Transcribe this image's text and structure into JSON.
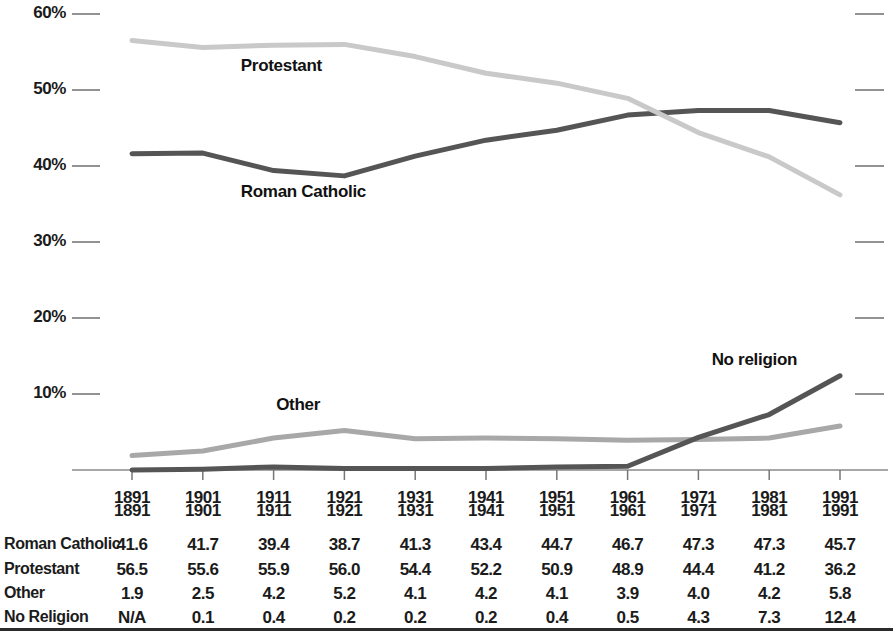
{
  "chart_data": {
    "type": "line",
    "title": "",
    "subtitle": "",
    "xlabel": "",
    "ylabel": "",
    "x": [
      1891,
      1901,
      1911,
      1921,
      1931,
      1941,
      1951,
      1961,
      1971,
      1981,
      1991
    ],
    "categories": [
      "1891",
      "1901",
      "1911",
      "1921",
      "1931",
      "1941",
      "1951",
      "1961",
      "1971",
      "1981",
      "1991"
    ],
    "ylim": [
      0,
      60
    ],
    "y_ticks": [
      10,
      20,
      30,
      40,
      50,
      60
    ],
    "y_tick_labels": [
      "10%",
      "20%",
      "30%",
      "40%",
      "50%",
      "60%"
    ],
    "grid": false,
    "legend_position": "inline-annotations",
    "series": [
      {
        "name": "Roman Catholic",
        "label": "Roman Catholic",
        "color": "#555555",
        "values": [
          41.6,
          41.7,
          39.4,
          38.7,
          41.3,
          43.4,
          44.7,
          46.7,
          47.3,
          47.3,
          45.7
        ],
        "display_values": [
          "41.6",
          "41.7",
          "39.4",
          "38.7",
          "41.3",
          "43.4",
          "44.7",
          "46.7",
          "47.3",
          "47.3",
          "45.7"
        ]
      },
      {
        "name": "Protestant",
        "label": "Protestant",
        "color": "#c9c9c9",
        "values": [
          56.5,
          55.6,
          55.9,
          56.0,
          54.4,
          52.2,
          50.9,
          48.9,
          44.4,
          41.2,
          36.2
        ],
        "display_values": [
          "56.5",
          "55.6",
          "55.9",
          "56.0",
          "54.4",
          "52.2",
          "50.9",
          "48.9",
          "44.4",
          "41.2",
          "36.2"
        ]
      },
      {
        "name": "Other",
        "label": "Other",
        "color": "#a8a8a8",
        "values": [
          1.9,
          2.5,
          4.2,
          5.2,
          4.1,
          4.2,
          4.1,
          3.9,
          4.0,
          4.2,
          5.8
        ],
        "display_values": [
          "1.9",
          "2.5",
          "4.2",
          "5.2",
          "4.1",
          "4.2",
          "4.1",
          "3.9",
          "4.0",
          "4.2",
          "5.8"
        ]
      },
      {
        "name": "No religion",
        "label": "No religion",
        "color": "#555555",
        "values": [
          0.0,
          0.1,
          0.4,
          0.2,
          0.2,
          0.2,
          0.4,
          0.5,
          4.3,
          7.3,
          12.4
        ],
        "display_values": [
          "N/A",
          "0.1",
          "0.4",
          "0.2",
          "0.2",
          "0.2",
          "0.4",
          "0.5",
          "4.3",
          "7.3",
          "12.4"
        ]
      }
    ],
    "annotations": [
      {
        "text": "Protestant",
        "x": 1901,
        "y": 53.0
      },
      {
        "text": "Roman Catholic",
        "x": 1901,
        "y": 36.5
      },
      {
        "text": "Other",
        "x": 1906,
        "y": 8.4
      },
      {
        "text": "No religion",
        "x": 1974,
        "y": 14.3
      }
    ]
  },
  "axis": {
    "y_labels": [
      "60%",
      "50%",
      "40%",
      "30%",
      "20%",
      "10%"
    ],
    "x_labels": [
      "1891",
      "1901",
      "1911",
      "1921",
      "1931",
      "1941",
      "1951",
      "1961",
      "1971",
      "1981",
      "1991"
    ]
  },
  "annotations": {
    "protestant": "Protestant",
    "roman_catholic": "Roman Catholic",
    "other": "Other",
    "no_religion": "No religion"
  },
  "table": {
    "header": [
      "1891",
      "1901",
      "1911",
      "1921",
      "1931",
      "1941",
      "1951",
      "1961",
      "1971",
      "1981",
      "1991"
    ],
    "rows": [
      {
        "label": "Roman Catholic",
        "values": [
          "41.6",
          "41.7",
          "39.4",
          "38.7",
          "41.3",
          "43.4",
          "44.7",
          "46.7",
          "47.3",
          "47.3",
          "45.7"
        ]
      },
      {
        "label": "Protestant",
        "values": [
          "56.5",
          "55.6",
          "55.9",
          "56.0",
          "54.4",
          "52.2",
          "50.9",
          "48.9",
          "44.4",
          "41.2",
          "36.2"
        ]
      },
      {
        "label": "Other",
        "values": [
          "1.9",
          "2.5",
          "4.2",
          "5.2",
          "4.1",
          "4.2",
          "4.1",
          "3.9",
          "4.0",
          "4.2",
          "5.8"
        ]
      },
      {
        "label": "No Religion",
        "values": [
          "N/A",
          "0.1",
          "0.4",
          "0.2",
          "0.2",
          "0.2",
          "0.4",
          "0.5",
          "4.3",
          "7.3",
          "12.4"
        ]
      }
    ]
  },
  "colors": {
    "dark_series": "#555555",
    "light_series": "#c9c9c9",
    "mid_series": "#a8a8a8",
    "axis": "#8a8a8a",
    "text": "#1b1b1b",
    "rule": "#2b2b2b"
  }
}
